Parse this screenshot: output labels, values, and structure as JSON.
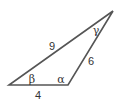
{
  "diagram": {
    "type": "triangle",
    "vertices": {
      "left": [
        9,
        85
      ],
      "bottom_right": [
        68,
        85
      ],
      "top": [
        113,
        11
      ]
    },
    "sides": [
      {
        "id": "hyp",
        "label": "9",
        "pos": [
          52,
          46
        ]
      },
      {
        "id": "right",
        "label": "6",
        "pos": [
          91,
          61
        ]
      },
      {
        "id": "base",
        "label": "4",
        "pos": [
          38,
          96
        ]
      }
    ],
    "angles": [
      {
        "id": "beta",
        "label": "β",
        "pos": [
          31,
          82
        ]
      },
      {
        "id": "alpha",
        "label": "α",
        "pos": [
          60,
          82
        ]
      },
      {
        "id": "gamma",
        "label": "γ",
        "pos": [
          95,
          32
        ]
      }
    ],
    "colors": {
      "stroke": "#555555",
      "text": "#333333"
    }
  }
}
